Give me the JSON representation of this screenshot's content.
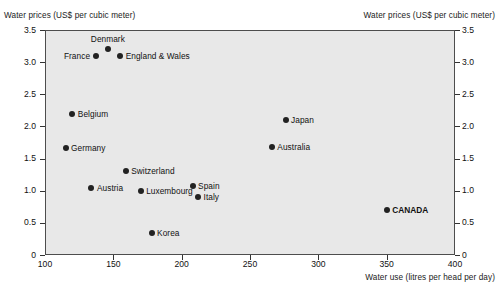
{
  "chart_data": {
    "type": "scatter",
    "title": "",
    "ylabel": "Water prices (US$ per cubic meter)",
    "ylabel_right": "Water prices (US$ per cubic meter)",
    "xlabel": "Water use (litres per head per day)",
    "xlim": [
      100,
      400
    ],
    "ylim": [
      0,
      3.5
    ],
    "xticks": [
      "100",
      "150",
      "200",
      "250",
      "300",
      "350",
      "400"
    ],
    "xtick_values": [
      100,
      150,
      200,
      250,
      300,
      350,
      400
    ],
    "yticks": [
      "0",
      "0.5",
      "1.0",
      "1.5",
      "2.0",
      "2.5",
      "3.0",
      "3.5"
    ],
    "ytick_values": [
      0,
      0.5,
      1.0,
      1.5,
      2.0,
      2.5,
      3.0,
      3.5
    ],
    "grid": false,
    "legend": "none",
    "points": [
      {
        "label": "France",
        "x": 137,
        "y": 3.1,
        "label_pos": "left",
        "emphasis": false
      },
      {
        "label": "Denmark",
        "x": 146,
        "y": 3.2,
        "label_pos": "above",
        "emphasis": false
      },
      {
        "label": "England & Wales",
        "x": 155,
        "y": 3.1,
        "label_pos": "right",
        "emphasis": false
      },
      {
        "label": "Belgium",
        "x": 120,
        "y": 2.2,
        "label_pos": "right",
        "emphasis": false
      },
      {
        "label": "Japan",
        "x": 276,
        "y": 2.1,
        "label_pos": "right",
        "emphasis": false
      },
      {
        "label": "Australia",
        "x": 266,
        "y": 1.68,
        "label_pos": "right",
        "emphasis": false
      },
      {
        "label": "Germany",
        "x": 115,
        "y": 1.67,
        "label_pos": "right",
        "emphasis": false
      },
      {
        "label": "Switzerland",
        "x": 159,
        "y": 1.3,
        "label_pos": "right",
        "emphasis": false
      },
      {
        "label": "Spain",
        "x": 208,
        "y": 1.07,
        "label_pos": "right",
        "emphasis": false
      },
      {
        "label": "Austria",
        "x": 134,
        "y": 1.05,
        "label_pos": "right",
        "emphasis": false
      },
      {
        "label": "Luxembourg",
        "x": 170,
        "y": 1.0,
        "label_pos": "right",
        "emphasis": false
      },
      {
        "label": "Italy",
        "x": 212,
        "y": 0.9,
        "label_pos": "right",
        "emphasis": false
      },
      {
        "label": "CANADA",
        "x": 350,
        "y": 0.7,
        "label_pos": "right",
        "emphasis": true
      },
      {
        "label": "Korea",
        "x": 178,
        "y": 0.35,
        "label_pos": "right",
        "emphasis": false
      }
    ]
  }
}
